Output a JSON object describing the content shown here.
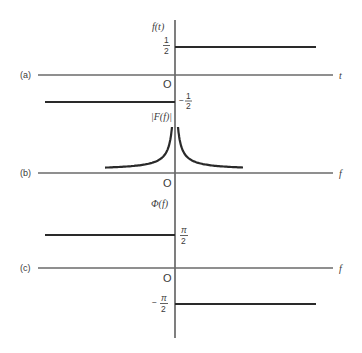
{
  "figure": {
    "panels": [
      {
        "id": "a",
        "label": "(a)",
        "function_label": "f(t)",
        "axis_variable": "t",
        "origin_label": "O",
        "description": "signum-like function: f(t) = 1/2 for t > 0, -1/2 for t < 0",
        "levels": [
          {
            "side": "right",
            "value": "1/2",
            "tick_num": "1",
            "tick_den": "2",
            "sign": ""
          },
          {
            "side": "left",
            "value": "-1/2",
            "tick_num": "1",
            "tick_den": "2",
            "sign": "−"
          }
        ]
      },
      {
        "id": "b",
        "label": "(b)",
        "function_label": "|F(f)|",
        "axis_variable": "f",
        "origin_label": "O",
        "description": "magnitude spectrum |F(f)| = 1/(2π|f|), symmetric hyperbolic peak at f = 0"
      },
      {
        "id": "c",
        "label": "(c)",
        "function_label": "Φ(f)",
        "axis_variable": "f",
        "origin_label": "O",
        "description": "phase spectrum: π/2 for f < 0, -π/2 for f > 0",
        "levels": [
          {
            "side": "left",
            "value": "π/2",
            "tick_num": "π",
            "tick_den": "2",
            "sign": ""
          },
          {
            "side": "right",
            "value": "-π/2",
            "tick_num": "π",
            "tick_den": "2",
            "sign": "−"
          }
        ]
      }
    ]
  }
}
